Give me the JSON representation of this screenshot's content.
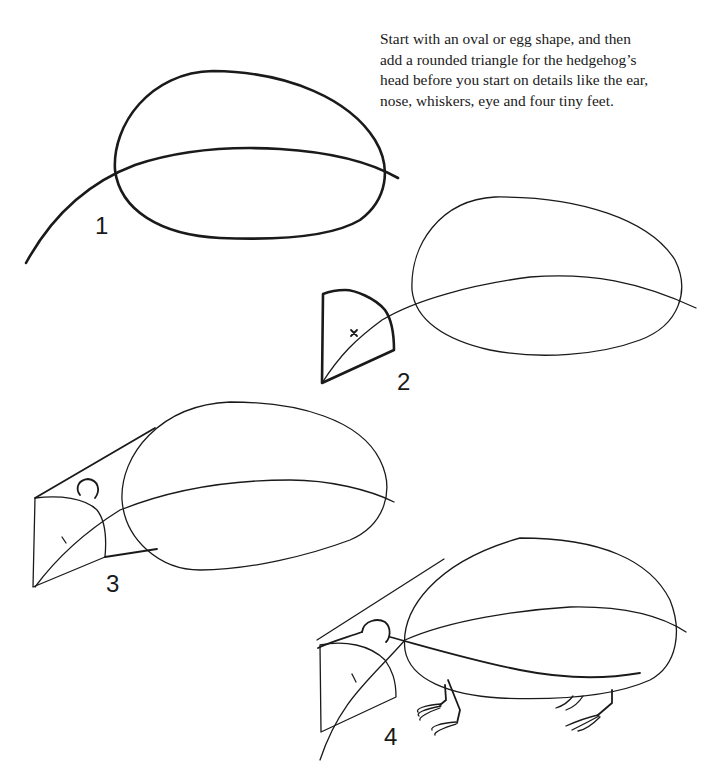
{
  "instructions": {
    "lines": [
      "Start with an oval or egg shape, and then",
      "add a rounded triangle for the hedgehog’s",
      "head before you start on details like the ear,",
      "nose, whiskers, eye and four tiny feet."
    ]
  },
  "steps": [
    {
      "number": "1",
      "label": "oval body and spine curve"
    },
    {
      "number": "2",
      "label": "rounded triangle head"
    },
    {
      "number": "3",
      "label": "head connected to body with ear"
    },
    {
      "number": "4",
      "label": "completed with ear, eye and feet"
    }
  ],
  "colors": {
    "ink": "#1a1a1a",
    "paper": "#ffffff"
  }
}
